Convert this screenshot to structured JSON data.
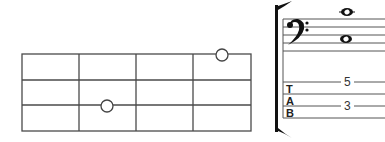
{
  "fretboard": {
    "strings": 4,
    "frets_shown": 4,
    "left": 22,
    "right": 251,
    "string_y": [
      54,
      80,
      105,
      131
    ],
    "fret_x": [
      22,
      79,
      136,
      193,
      251
    ],
    "markers": [
      {
        "string": 1,
        "position_x": 222,
        "y": 55,
        "style": "open-circle"
      },
      {
        "string": 3,
        "position_x": 107,
        "y": 106,
        "style": "open-circle"
      }
    ]
  },
  "notation": {
    "clef": "bass",
    "clef_glyph": "𝄢",
    "notes": [
      {
        "type": "whole",
        "position": "above-staff-ledger",
        "x": 346,
        "y": 12
      },
      {
        "type": "whole",
        "position": "space-between-lines-3-4",
        "x": 346,
        "y": 39
      }
    ],
    "staff_lines_y": [
      19,
      27,
      35,
      43,
      51
    ]
  },
  "tablature": {
    "label_letters": [
      "T",
      "A",
      "B"
    ],
    "lines_y": [
      82,
      94,
      106,
      118
    ],
    "numbers": [
      {
        "value": "5",
        "line": 1,
        "x": 347,
        "y": 82
      },
      {
        "value": "3",
        "line": 3,
        "x": 347,
        "y": 106
      }
    ]
  },
  "colors": {
    "ink": "#4a4a4a",
    "background": "#ffffff"
  }
}
